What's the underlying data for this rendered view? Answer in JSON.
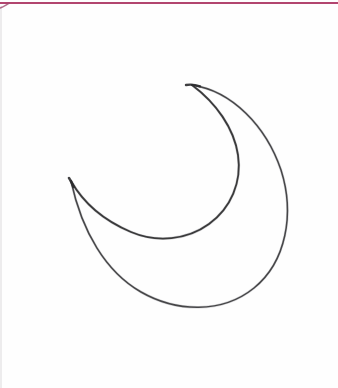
{
  "page": {
    "title": "Crescent Moon Sketch",
    "width": 338,
    "height": 388,
    "background_color": "#ffffff",
    "paper_color": "#fefefe",
    "medium": "hand-drawn pencil line sketch on white paper"
  },
  "rules": {
    "top_margin": {
      "name": "top-margin-rule",
      "color": "#b2456f",
      "x1": 0,
      "y1": 3,
      "x2": 338,
      "y2": 3,
      "thickness": 2
    },
    "left_margin": {
      "name": "left-edge-rule",
      "color": "#e6e4e6",
      "x1": 1,
      "y1": 6,
      "x2": 1,
      "y2": 388,
      "thickness": 1
    }
  },
  "drawing": {
    "subject": "crescent-moon",
    "stroke_color": "#3a3a3c",
    "stroke_color_light": "#6a6a6e",
    "stroke_width": 1.6,
    "tips": {
      "upper_tip": {
        "x": 192,
        "y": 85
      },
      "lower_tip": {
        "x": 71,
        "y": 181
      }
    },
    "outer_arc": {
      "name": "outer-crescent-arc",
      "path": "M192,85 C232,91 266,126 281,170 C295,214 286,262 254,288 C222,314 176,312 141,292 C106,272 82,232 71,181",
      "extreme_right": {
        "x": 283,
        "y": 196
      },
      "extreme_bottom": {
        "x": 186,
        "y": 303
      }
    },
    "inner_arc": {
      "name": "inner-crescent-arc",
      "path": "M192,85 C216,103 234,128 238,155 C242,182 231,208 209,224 C187,240 157,243 131,232 C105,221 84,204 71,181",
      "extreme_right": {
        "x": 240,
        "y": 154
      },
      "extreme_bottom": {
        "x": 172,
        "y": 236
      }
    }
  }
}
